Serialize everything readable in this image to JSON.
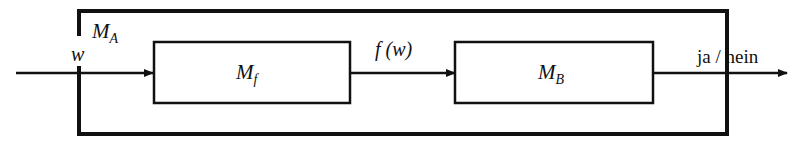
{
  "diagram": {
    "outer_machine": {
      "label": "M",
      "subscript": "A"
    },
    "input": {
      "label": "w"
    },
    "machine_f": {
      "label": "M",
      "subscript": "f"
    },
    "intermediate": {
      "label": "f (w)"
    },
    "machine_b": {
      "label": "M",
      "subscript": "B"
    },
    "output": {
      "label": "ja / nein"
    },
    "colors": {
      "stroke": "#111111",
      "background": "#ffffff"
    }
  }
}
